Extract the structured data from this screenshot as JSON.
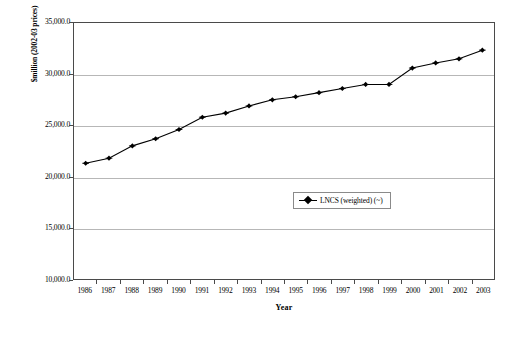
{
  "chart_data": {
    "type": "line",
    "title": "",
    "xlabel": "Year",
    "ylabel": "$million (2002-03 prices)",
    "categories": [
      "1986",
      "1987",
      "1988",
      "1989",
      "1990",
      "1991",
      "1992",
      "1993",
      "1994",
      "1995",
      "1996",
      "1997",
      "1998",
      "1999",
      "2000",
      "2001",
      "2002",
      "2003"
    ],
    "series": [
      {
        "name": "LNCS (weighted) (~)",
        "marker": "diamond",
        "color": "#000000",
        "values": [
          21300,
          21800,
          23000,
          23700,
          24600,
          25800,
          26200,
          26900,
          27500,
          27800,
          28200,
          28600,
          29000,
          29000,
          30600,
          31100,
          31500,
          32350
        ]
      }
    ],
    "ylim": [
      10000,
      35000
    ],
    "ytick_step": 5000,
    "ytick_labels": [
      "35,000.0",
      "30,000.0",
      "25,000.0",
      "20,000.0",
      "15,000.0",
      "10,000.0"
    ],
    "ytick_values": [
      35000,
      30000,
      25000,
      20000,
      15000,
      10000
    ],
    "grid": "horizontal",
    "legend_position": "center"
  },
  "legend": {
    "entries": [
      {
        "label": "LNCS (weighted) (~)"
      }
    ]
  },
  "axes": {
    "y_title": "$million (2002-03 prices)",
    "x_title": "Year"
  }
}
